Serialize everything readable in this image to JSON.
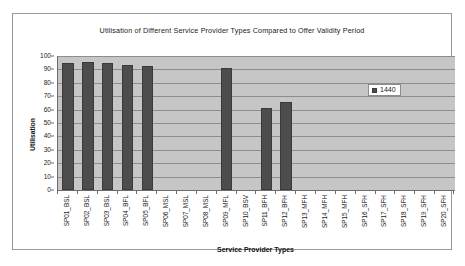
{
  "chart_data": {
    "type": "bar",
    "title": "Utilisation of Different Service Provider Types Compared to Offer Validity Period",
    "xlabel": "Service Provider Types",
    "ylabel": "Utilisation",
    "ylim": [
      0,
      100
    ],
    "ytick_step": 10,
    "yticks": [
      "100",
      "90",
      "80",
      "70",
      "60",
      "50",
      "40",
      "30",
      "20",
      "10",
      "0"
    ],
    "grid": true,
    "legend_position": "inside-right",
    "categories": [
      "SP01_BSL",
      "SP02_BSL",
      "SP03_BSL",
      "SP04_BFL",
      "SP05_BFL",
      "SP06_MSL",
      "SP07_MSL",
      "SP08_MSL",
      "SP09_MFL",
      "SP10_BSV",
      "SP11_BFH",
      "SP12_BFH",
      "SP13_MFH",
      "SP14_MFH",
      "SP15_MFH",
      "SP16_SFH",
      "SP17_SFH",
      "SP18_SFH",
      "SP19_SFH",
      "SP20_SFH"
    ],
    "series": [
      {
        "name": "1440",
        "color": "#4d4d4d",
        "values": [
          95,
          95.5,
          95,
          93,
          92.5,
          0,
          0,
          0,
          91,
          0,
          61,
          66,
          0,
          0,
          0,
          0,
          0,
          0,
          0,
          0
        ]
      }
    ],
    "legend": [
      {
        "label": "1440",
        "color": "#4d4d4d"
      }
    ],
    "colors": {
      "bar": "#4d4d4d",
      "plot_background": "#c6c6c6",
      "gridline": "#8d8d8d",
      "axis": "#6d6d6d",
      "frame_border": "#9a9a9a",
      "text": "#1a1a1a"
    }
  }
}
